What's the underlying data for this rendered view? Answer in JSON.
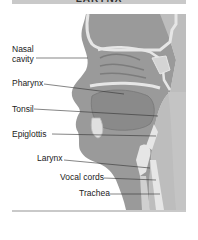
{
  "header": {
    "title": "LARYNX"
  },
  "figure": {
    "labels": [
      {
        "text": "Nasal\ncavity",
        "line1": "Nasal",
        "line2": "cavity"
      },
      {
        "text": "Pharynx"
      },
      {
        "text": "Tonsil"
      },
      {
        "text": "Epiglottis"
      },
      {
        "text": "Larynx"
      },
      {
        "text": "Vocal cords"
      },
      {
        "text": "Trachea"
      }
    ]
  },
  "colors": {
    "tissue": "#9a9a9a",
    "tissue_light": "#bdbdbd",
    "bone": "#e6e6e6",
    "background_band": "#c9c9c9"
  }
}
